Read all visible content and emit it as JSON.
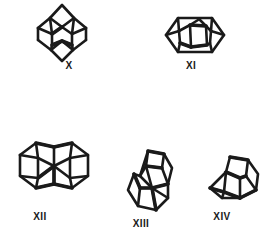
{
  "figure": {
    "kind": "chemical-structure-plate",
    "background_color": "#ffffff",
    "ink_color": "#1a1a1a",
    "width": 279,
    "height": 246,
    "caption": ""
  },
  "structures": [
    {
      "id": "structure-x",
      "label": "X",
      "description": "Polycyclic cage hydrocarbon skeleton, vertically elongated diamond-shaped diamondoid drawn in perspective with apex spikes top and bottom",
      "label_x": 68,
      "label_y": 64
    },
    {
      "id": "structure-xi",
      "label": "XI",
      "description": "Polycyclic cage hydrocarbon skeleton, horizontally elongated hexagonal diamondoid drawn in perspective with inner ring visible",
      "label_x": 190,
      "label_y": 64
    },
    {
      "id": "structure-xii",
      "label": "XII",
      "description": "Polycyclic cage hydrocarbon skeleton, fused two-cage diamantane-type drawn in perspective, widest structure",
      "label_x": 37,
      "label_y": 215
    },
    {
      "id": "structure-xiii",
      "label": "XIII",
      "description": "Polycyclic cage hydrocarbon skeleton, two fused cages stacked diagonally in perspective",
      "label_x": 140,
      "label_y": 222
    },
    {
      "id": "structure-xiv",
      "label": "XIV",
      "description": "Polycyclic cage hydrocarbon skeleton, single adamantane cage drawn in perspective",
      "label_x": 218,
      "label_y": 215
    }
  ]
}
